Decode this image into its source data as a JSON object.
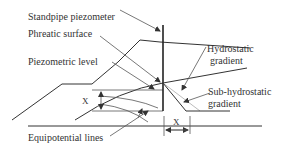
{
  "diagram": {
    "labels": {
      "standpipe": "Standpipe piezometer",
      "phreatic": "Phreatic surface",
      "piezometric": "Piezometric level",
      "hydrostatic_1": "Hydrostatic",
      "hydrostatic_2": "gradient",
      "subhydro_1": "Sub-hydrostatic",
      "subhydro_2": "gradient",
      "equipotential": "Equipotential lines",
      "x_vertical": "X",
      "x_horizontal": "X"
    },
    "colors": {
      "line": "#333333",
      "hydrostatic_line": "#aaaaaa",
      "background": "#ffffff"
    }
  }
}
